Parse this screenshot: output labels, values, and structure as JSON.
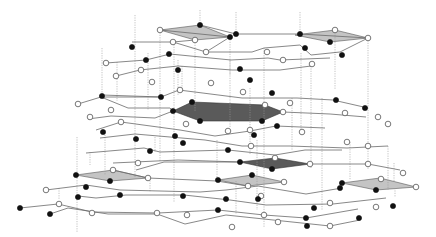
{
  "figure": {
    "title": "",
    "colors": {
      "black_node": "#111111",
      "white_node": "#ffffff",
      "edge": "#6a6a6a",
      "vertical_link": "#9a9a9a",
      "light_face": "#c4c4c4",
      "dark_face": "#5a5a5a"
    },
    "faces": [
      {
        "shade": "light",
        "points": [
          [
            160,
            30
          ],
          [
            200,
            25
          ],
          [
            230,
            37
          ],
          [
            195,
            40
          ]
        ]
      },
      {
        "shade": "light",
        "points": [
          [
            295,
            35
          ],
          [
            335,
            30
          ],
          [
            368,
            38
          ],
          [
            330,
            42
          ]
        ]
      },
      {
        "shade": "dark",
        "points": [
          [
            173,
            111
          ],
          [
            192,
            102
          ],
          [
            265,
            105
          ],
          [
            283,
            112
          ],
          [
            262,
            121
          ],
          [
            200,
            121
          ]
        ]
      },
      {
        "shade": "dark",
        "points": [
          [
            240,
            162
          ],
          [
            275,
            158
          ],
          [
            310,
            164
          ],
          [
            272,
            169
          ]
        ]
      },
      {
        "shade": "light",
        "points": [
          [
            76,
            175
          ],
          [
            113,
            170
          ],
          [
            148,
            178
          ],
          [
            110,
            181
          ]
        ]
      },
      {
        "shade": "light",
        "points": [
          [
            218,
            180
          ],
          [
            252,
            175
          ],
          [
            284,
            182
          ],
          [
            248,
            186
          ]
        ]
      },
      {
        "shade": "light",
        "points": [
          [
            342,
            183
          ],
          [
            380,
            178
          ],
          [
            416,
            187
          ],
          [
            376,
            190
          ]
        ]
      }
    ],
    "vertical_links": [
      [
        135,
        15,
        135,
        178
      ],
      [
        160,
        30,
        160,
        162
      ],
      [
        174,
        42,
        174,
        202
      ],
      [
        200,
        10,
        200,
        25
      ],
      [
        195,
        40,
        195,
        112
      ],
      [
        230,
        37,
        230,
        128
      ],
      [
        236,
        12,
        236,
        34
      ],
      [
        300,
        12,
        300,
        34
      ],
      [
        335,
        30,
        335,
        90
      ],
      [
        368,
        38,
        368,
        170
      ],
      [
        264,
        48,
        264,
        228
      ],
      [
        301,
        53,
        301,
        131
      ],
      [
        311,
        66,
        311,
        168
      ],
      [
        292,
        98,
        292,
        150
      ],
      [
        322,
        98,
        322,
        210
      ],
      [
        102,
        48,
        102,
        95
      ],
      [
        117,
        62,
        117,
        101
      ],
      [
        148,
        53,
        148,
        110
      ],
      [
        90,
        152,
        90,
        165
      ],
      [
        77,
        137,
        77,
        233
      ],
      [
        105,
        130,
        105,
        175
      ],
      [
        217,
        140,
        217,
        178
      ],
      [
        257,
        140,
        257,
        210
      ],
      [
        236,
        181,
        236,
        214
      ],
      [
        230,
        60,
        230,
        75
      ],
      [
        178,
        60,
        178,
        95
      ],
      [
        182,
        66,
        182,
        90
      ],
      [
        250,
        88,
        250,
        154
      ],
      [
        388,
        146,
        388,
        190
      ],
      [
        394,
        163,
        394,
        182
      ],
      [
        350,
        142,
        350,
        180
      ],
      [
        395,
        188,
        395,
        197
      ],
      [
        155,
        137,
        155,
        152
      ],
      [
        150,
        178,
        150,
        192
      ],
      [
        59,
        188,
        59,
        200
      ]
    ],
    "edges": [
      [
        160,
        30,
        230,
        37
      ],
      [
        200,
        25,
        236,
        34
      ],
      [
        236,
        34,
        300,
        34
      ],
      [
        300,
        34,
        368,
        38
      ],
      [
        132,
        42,
        173,
        42
      ],
      [
        173,
        42,
        206,
        52
      ],
      [
        173,
        42,
        195,
        40
      ],
      [
        206,
        52,
        230,
        37
      ],
      [
        206,
        52,
        252,
        52
      ],
      [
        252,
        52,
        264,
        48
      ],
      [
        264,
        48,
        300,
        45
      ],
      [
        300,
        45,
        311,
        55
      ],
      [
        311,
        55,
        340,
        52
      ],
      [
        340,
        52,
        368,
        38
      ],
      [
        106,
        63,
        146,
        60
      ],
      [
        146,
        60,
        170,
        54
      ],
      [
        170,
        54,
        231,
        60
      ],
      [
        231,
        60,
        268,
        58
      ],
      [
        268,
        58,
        280,
        60
      ],
      [
        280,
        60,
        330,
        58
      ],
      [
        116,
        76,
        140,
        70
      ],
      [
        140,
        70,
        178,
        66
      ],
      [
        178,
        66,
        232,
        70
      ],
      [
        232,
        70,
        280,
        70
      ],
      [
        280,
        70,
        311,
        66
      ],
      [
        102,
        95,
        161,
        97
      ],
      [
        161,
        97,
        179,
        90
      ],
      [
        179,
        90,
        242,
        98
      ],
      [
        242,
        98,
        297,
        98
      ],
      [
        297,
        98,
        333,
        100
      ],
      [
        333,
        100,
        368,
        108
      ],
      [
        78,
        104,
        101,
        97
      ],
      [
        101,
        97,
        161,
        97
      ],
      [
        101,
        97,
        128,
        108
      ],
      [
        128,
        108,
        170,
        108
      ],
      [
        170,
        108,
        173,
        111
      ],
      [
        88,
        119,
        111,
        116
      ],
      [
        111,
        116,
        155,
        118
      ],
      [
        155,
        118,
        173,
        111
      ],
      [
        283,
        112,
        330,
        114
      ],
      [
        330,
        114,
        366,
        117
      ],
      [
        96,
        130,
        121,
        122
      ],
      [
        121,
        122,
        180,
        130
      ],
      [
        180,
        130,
        215,
        136
      ],
      [
        215,
        136,
        250,
        131
      ],
      [
        250,
        131,
        276,
        126
      ],
      [
        276,
        126,
        325,
        128
      ],
      [
        100,
        138,
        135,
        134
      ],
      [
        135,
        134,
        205,
        140
      ],
      [
        205,
        140,
        242,
        146
      ],
      [
        242,
        146,
        290,
        146
      ],
      [
        290,
        146,
        347,
        148
      ],
      [
        347,
        148,
        388,
        146
      ],
      [
        86,
        153,
        144,
        148
      ],
      [
        144,
        148,
        160,
        152
      ],
      [
        160,
        152,
        228,
        150
      ],
      [
        228,
        150,
        275,
        155
      ],
      [
        275,
        155,
        305,
        150
      ],
      [
        305,
        150,
        342,
        150
      ],
      [
        113,
        163,
        178,
        160
      ],
      [
        178,
        160,
        240,
        162
      ],
      [
        310,
        164,
        368,
        164
      ],
      [
        368,
        164,
        400,
        170
      ],
      [
        136,
        170,
        164,
        162
      ],
      [
        164,
        162,
        240,
        162
      ],
      [
        113,
        170,
        148,
        178
      ],
      [
        148,
        178,
        217,
        181
      ],
      [
        217,
        181,
        247,
        186
      ],
      [
        46,
        190,
        86,
        185
      ],
      [
        86,
        185,
        120,
        190
      ],
      [
        120,
        190,
        200,
        192
      ],
      [
        200,
        192,
        226,
        190
      ],
      [
        226,
        190,
        258,
        186
      ],
      [
        258,
        186,
        306,
        194
      ],
      [
        306,
        194,
        342,
        188
      ],
      [
        78,
        196,
        96,
        198
      ],
      [
        96,
        198,
        126,
        195
      ],
      [
        126,
        195,
        184,
        195
      ],
      [
        184,
        195,
        230,
        200
      ],
      [
        230,
        200,
        266,
        205
      ],
      [
        266,
        205,
        333,
        204
      ],
      [
        333,
        204,
        386,
        198
      ],
      [
        20,
        208,
        58,
        204
      ],
      [
        58,
        204,
        92,
        212
      ],
      [
        92,
        212,
        158,
        213
      ],
      [
        158,
        213,
        218,
        210
      ],
      [
        218,
        210,
        264,
        215
      ],
      [
        264,
        215,
        306,
        218
      ],
      [
        306,
        218,
        358,
        209
      ],
      [
        50,
        214,
        68,
        208
      ],
      [
        68,
        208,
        108,
        214
      ],
      [
        108,
        214,
        157,
        214
      ],
      [
        157,
        214,
        185,
        224
      ],
      [
        185,
        224,
        226,
        215
      ],
      [
        226,
        215,
        330,
        226
      ],
      [
        330,
        226,
        360,
        220
      ]
    ],
    "nodes": [
      {
        "x": 200,
        "y": 25,
        "type": "black"
      },
      {
        "x": 160,
        "y": 30,
        "type": "white"
      },
      {
        "x": 230,
        "y": 37,
        "type": "black"
      },
      {
        "x": 195,
        "y": 40,
        "type": "white"
      },
      {
        "x": 236,
        "y": 34,
        "type": "black"
      },
      {
        "x": 300,
        "y": 34,
        "type": "black"
      },
      {
        "x": 335,
        "y": 30,
        "type": "white"
      },
      {
        "x": 368,
        "y": 38,
        "type": "white"
      },
      {
        "x": 330,
        "y": 42,
        "type": "black"
      },
      {
        "x": 305,
        "y": 48,
        "type": "black"
      },
      {
        "x": 342,
        "y": 55,
        "type": "black"
      },
      {
        "x": 132,
        "y": 47,
        "type": "black"
      },
      {
        "x": 173,
        "y": 42,
        "type": "white"
      },
      {
        "x": 169,
        "y": 54,
        "type": "black"
      },
      {
        "x": 206,
        "y": 52,
        "type": "white"
      },
      {
        "x": 267,
        "y": 52,
        "type": "white"
      },
      {
        "x": 283,
        "y": 60,
        "type": "white"
      },
      {
        "x": 312,
        "y": 64,
        "type": "white"
      },
      {
        "x": 106,
        "y": 63,
        "type": "white"
      },
      {
        "x": 146,
        "y": 60,
        "type": "black"
      },
      {
        "x": 178,
        "y": 70,
        "type": "black"
      },
      {
        "x": 116,
        "y": 76,
        "type": "white"
      },
      {
        "x": 141,
        "y": 70,
        "type": "white"
      },
      {
        "x": 152,
        "y": 82,
        "type": "white"
      },
      {
        "x": 211,
        "y": 83,
        "type": "white"
      },
      {
        "x": 240,
        "y": 69,
        "type": "black"
      },
      {
        "x": 250,
        "y": 80,
        "type": "black"
      },
      {
        "x": 102,
        "y": 96,
        "type": "black"
      },
      {
        "x": 78,
        "y": 104,
        "type": "white"
      },
      {
        "x": 161,
        "y": 97,
        "type": "black"
      },
      {
        "x": 180,
        "y": 90,
        "type": "white"
      },
      {
        "x": 111,
        "y": 110,
        "type": "white"
      },
      {
        "x": 90,
        "y": 117,
        "type": "white"
      },
      {
        "x": 173,
        "y": 111,
        "type": "black"
      },
      {
        "x": 192,
        "y": 102,
        "type": "black"
      },
      {
        "x": 265,
        "y": 105,
        "type": "white"
      },
      {
        "x": 283,
        "y": 112,
        "type": "white"
      },
      {
        "x": 262,
        "y": 121,
        "type": "black"
      },
      {
        "x": 200,
        "y": 121,
        "type": "black"
      },
      {
        "x": 243,
        "y": 92,
        "type": "white"
      },
      {
        "x": 272,
        "y": 93,
        "type": "black"
      },
      {
        "x": 290,
        "y": 103,
        "type": "white"
      },
      {
        "x": 336,
        "y": 100,
        "type": "black"
      },
      {
        "x": 365,
        "y": 108,
        "type": "black"
      },
      {
        "x": 345,
        "y": 113,
        "type": "white"
      },
      {
        "x": 378,
        "y": 117,
        "type": "white"
      },
      {
        "x": 388,
        "y": 124,
        "type": "white"
      },
      {
        "x": 186,
        "y": 124,
        "type": "white"
      },
      {
        "x": 121,
        "y": 122,
        "type": "white"
      },
      {
        "x": 103,
        "y": 132,
        "type": "black"
      },
      {
        "x": 175,
        "y": 136,
        "type": "black"
      },
      {
        "x": 136,
        "y": 139,
        "type": "black"
      },
      {
        "x": 183,
        "y": 143,
        "type": "black"
      },
      {
        "x": 150,
        "y": 151,
        "type": "black"
      },
      {
        "x": 228,
        "y": 150,
        "type": "black"
      },
      {
        "x": 251,
        "y": 146,
        "type": "white"
      },
      {
        "x": 277,
        "y": 126,
        "type": "black"
      },
      {
        "x": 250,
        "y": 130,
        "type": "white"
      },
      {
        "x": 302,
        "y": 132,
        "type": "white"
      },
      {
        "x": 254,
        "y": 135,
        "type": "black"
      },
      {
        "x": 228,
        "y": 131,
        "type": "white"
      },
      {
        "x": 347,
        "y": 142,
        "type": "white"
      },
      {
        "x": 368,
        "y": 146,
        "type": "white"
      },
      {
        "x": 240,
        "y": 162,
        "type": "black"
      },
      {
        "x": 275,
        "y": 158,
        "type": "white"
      },
      {
        "x": 310,
        "y": 164,
        "type": "white"
      },
      {
        "x": 272,
        "y": 169,
        "type": "black"
      },
      {
        "x": 368,
        "y": 164,
        "type": "white"
      },
      {
        "x": 403,
        "y": 173,
        "type": "white"
      },
      {
        "x": 381,
        "y": 179,
        "type": "white"
      },
      {
        "x": 76,
        "y": 175,
        "type": "black"
      },
      {
        "x": 113,
        "y": 170,
        "type": "white"
      },
      {
        "x": 138,
        "y": 163,
        "type": "white"
      },
      {
        "x": 148,
        "y": 178,
        "type": "white"
      },
      {
        "x": 110,
        "y": 181,
        "type": "black"
      },
      {
        "x": 86,
        "y": 187,
        "type": "black"
      },
      {
        "x": 46,
        "y": 190,
        "type": "white"
      },
      {
        "x": 218,
        "y": 180,
        "type": "black"
      },
      {
        "x": 252,
        "y": 175,
        "type": "black"
      },
      {
        "x": 284,
        "y": 182,
        "type": "white"
      },
      {
        "x": 248,
        "y": 186,
        "type": "white"
      },
      {
        "x": 342,
        "y": 183,
        "type": "black"
      },
      {
        "x": 416,
        "y": 187,
        "type": "white"
      },
      {
        "x": 376,
        "y": 190,
        "type": "black"
      },
      {
        "x": 120,
        "y": 195,
        "type": "black"
      },
      {
        "x": 78,
        "y": 197,
        "type": "black"
      },
      {
        "x": 183,
        "y": 196,
        "type": "black"
      },
      {
        "x": 226,
        "y": 199,
        "type": "black"
      },
      {
        "x": 261,
        "y": 196,
        "type": "white"
      },
      {
        "x": 340,
        "y": 188,
        "type": "black"
      },
      {
        "x": 258,
        "y": 199,
        "type": "black"
      },
      {
        "x": 157,
        "y": 213,
        "type": "white"
      },
      {
        "x": 59,
        "y": 204,
        "type": "white"
      },
      {
        "x": 20,
        "y": 208,
        "type": "black"
      },
      {
        "x": 92,
        "y": 213,
        "type": "white"
      },
      {
        "x": 50,
        "y": 214,
        "type": "black"
      },
      {
        "x": 218,
        "y": 210,
        "type": "black"
      },
      {
        "x": 264,
        "y": 215,
        "type": "white"
      },
      {
        "x": 314,
        "y": 208,
        "type": "black"
      },
      {
        "x": 330,
        "y": 203,
        "type": "white"
      },
      {
        "x": 306,
        "y": 218,
        "type": "black"
      },
      {
        "x": 187,
        "y": 215,
        "type": "white"
      },
      {
        "x": 359,
        "y": 218,
        "type": "black"
      },
      {
        "x": 376,
        "y": 207,
        "type": "white"
      },
      {
        "x": 393,
        "y": 206,
        "type": "black"
      },
      {
        "x": 307,
        "y": 226,
        "type": "black"
      },
      {
        "x": 330,
        "y": 226,
        "type": "white"
      },
      {
        "x": 278,
        "y": 222,
        "type": "white"
      },
      {
        "x": 232,
        "y": 227,
        "type": "white"
      }
    ]
  }
}
